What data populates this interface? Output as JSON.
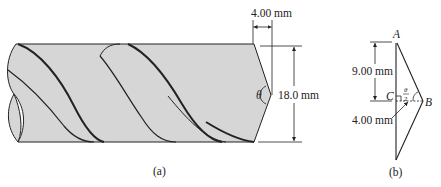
{
  "figure_a": {
    "caption": "(a)",
    "dim_tip_length": "4.00 mm",
    "dim_diameter": "18.0 mm",
    "angle_symbol": "θ"
  },
  "figure_b": {
    "caption": "(b)",
    "point_A": "A",
    "point_B": "B",
    "point_C": "C",
    "dim_AC": "9.00 mm",
    "dim_CB": "4.00 mm",
    "angle_num": "θ",
    "angle_den": "2"
  },
  "colors": {
    "drill_fill": "#d6d6d6",
    "stroke": "#222222"
  }
}
